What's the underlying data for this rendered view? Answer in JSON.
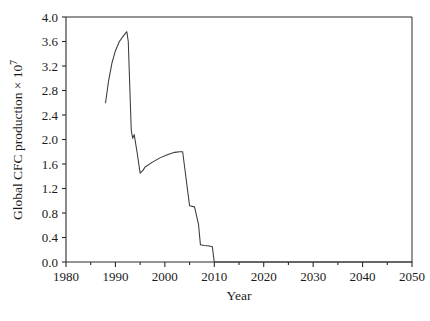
{
  "chart_data": {
    "type": "line",
    "title": "",
    "xlabel": "Year",
    "ylabel": "Global CFC production × 10⁷",
    "ylabel_base": "Global CFC production × 10",
    "ylabel_exponent": "7",
    "xlim": [
      1980,
      2050
    ],
    "ylim": [
      0.0,
      4.0
    ],
    "grid": false,
    "legend": "none",
    "xticks": [
      1980,
      1990,
      2000,
      2010,
      2020,
      2030,
      2040,
      2050
    ],
    "xticklabels": [
      "1980",
      "1990",
      "2000",
      "2010",
      "2020",
      "2030",
      "2040",
      "2050"
    ],
    "xtick_minor_count_between": 1,
    "yticks": [
      0.0,
      0.4,
      0.8,
      1.2,
      1.6,
      2.0,
      2.4,
      2.8,
      3.2,
      3.6,
      4.0
    ],
    "yticklabels": [
      "0.0",
      "0.4",
      "0.8",
      "1.2",
      "1.6",
      "2.0",
      "2.4",
      "2.8",
      "3.2",
      "3.6",
      "4.0"
    ],
    "series": [
      {
        "name": "Global CFC production",
        "color": "#3a3a3a",
        "x": [
          1988.0,
          1988.6,
          1989.3,
          1990.0,
          1990.8,
          1991.5,
          1992.3,
          1992.6,
          1993.2,
          1993.5,
          1993.8,
          1994.4,
          1995.0,
          1995.6,
          1996.0,
          1997.5,
          1999.0,
          2000.5,
          2002.0,
          2003.0,
          2003.6,
          2004.2,
          2005.0,
          2006.0,
          2006.8,
          2007.2,
          2008.0,
          2009.0,
          2009.6,
          2010.0,
          2050.0
        ],
        "y": [
          2.6,
          2.95,
          3.25,
          3.45,
          3.6,
          3.68,
          3.76,
          3.6,
          2.15,
          2.02,
          2.08,
          1.78,
          1.45,
          1.5,
          1.55,
          1.63,
          1.7,
          1.75,
          1.79,
          1.8,
          1.8,
          1.42,
          0.92,
          0.9,
          0.62,
          0.28,
          0.27,
          0.26,
          0.25,
          0.0,
          0.0
        ]
      }
    ]
  }
}
